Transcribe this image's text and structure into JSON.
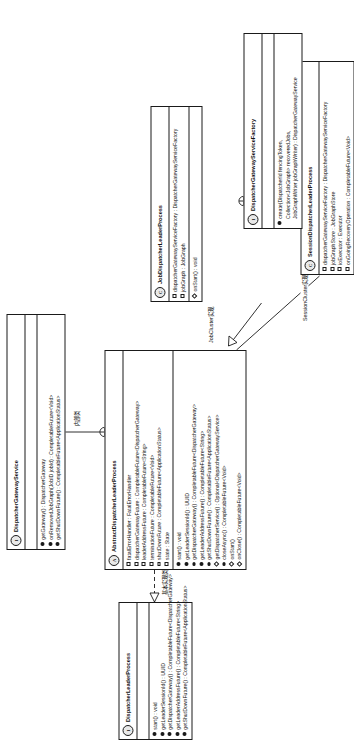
{
  "diagram": {
    "type": "uml-class-diagram",
    "orientation": "landscape-on-portrait-page",
    "colors": {
      "line": "#1a1a1a",
      "background": "#ffffff",
      "badge_fill": "#e9e9e9"
    },
    "edge_labels": {
      "basic_impl": "基本实现类",
      "inner_class": "内部类",
      "inner_class_2": "内部类",
      "job_cluster_impl": "JobCluster实现",
      "session_cluster_impl": "SessionCluster实现"
    }
  },
  "classes": {
    "dispatcher_leader_process": {
      "stereotype": "I",
      "name": "DispatcherLeaderProcess",
      "attributes": [],
      "methods": [
        {
          "marker": "public",
          "text": "start() : void"
        },
        {
          "marker": "public",
          "text": "getLeaderSessionId() : UUID"
        },
        {
          "marker": "public",
          "text": "getDispatcherGateway() : CompletableFuture<DispatcherGateway>"
        },
        {
          "marker": "public",
          "text": "getLeaderAddressFuture() : CompletableFuture<String>"
        },
        {
          "marker": "public",
          "text": "getShutDownFuture() : CompletableFuture<ApplicationStatus>"
        }
      ]
    },
    "abstract_dispatcher_leader_process": {
      "stereotype": "A",
      "name": "AbstractDispatcherLeaderProcess",
      "attributes": [
        {
          "marker": "attribute",
          "text": "fatalErrorHandler : FatalErrorHandler"
        },
        {
          "marker": "attribute",
          "text": "dispatcherGatewayFuture : CompletableFuture<DispatcherGateway>"
        },
        {
          "marker": "attribute",
          "text": "leaderAddressFuture : CompletableFuture<String>"
        },
        {
          "marker": "attribute",
          "text": "terminationFuture : CompletableFuture<Void>"
        },
        {
          "marker": "attribute",
          "text": "shutDownFuture : CompletableFuture<ApplicationStatus>"
        },
        {
          "marker": "attribute",
          "text": "state : State"
        }
      ],
      "methods": [
        {
          "marker": "public",
          "text": "start() : void"
        },
        {
          "marker": "public",
          "text": "getLeaderSessionId() : UUID"
        },
        {
          "marker": "public",
          "text": "getDispatcherGateway() : CompletableFuture<DispatcherGateway>"
        },
        {
          "marker": "public",
          "text": "getLeaderAddressFuture() : CompletableFuture<String>"
        },
        {
          "marker": "public",
          "text": "getShutDownFuture() : CompletableFuture<ApplicationStatus>"
        },
        {
          "marker": "protected",
          "text": "getDispatcherService() : Optional<DispatcherGatewayService>"
        },
        {
          "marker": "public",
          "text": "closeAsync() : CompletableFuture<Void>"
        },
        {
          "marker": "protected",
          "text": "onStart()"
        },
        {
          "marker": "protected",
          "text": "onClose() : CompletableFuture<Void>"
        }
      ]
    },
    "dispatcher_gateway_service": {
      "stereotype": "I",
      "name": "DispatcherGatewayService",
      "attributes": [],
      "methods": [
        {
          "marker": "public",
          "text": "getGateway() : DispatcherGateway"
        },
        {
          "marker": "public",
          "text": "onRemovedJobGraph(JobID jobId) : CompletableFuture<Void>"
        },
        {
          "marker": "public",
          "text": "getShutDownFuture() : CompletableFuture<ApplicationStatus>"
        }
      ]
    },
    "job_dispatcher_leader_process": {
      "stereotype": "C",
      "name": "JobDispatcherLeaderProcess",
      "attributes": [
        {
          "marker": "attribute",
          "text": "dispatcherGatewayServiceFactory : DispatcherGatewayServiceFactory"
        },
        {
          "marker": "attribute",
          "text": "jobGraph : JobGraph"
        }
      ],
      "methods": [
        {
          "marker": "protected",
          "text": "onStart() : void"
        }
      ]
    },
    "session_dispatcher_leader_process": {
      "stereotype": "C",
      "name": "SessionDispatcherLeaderProcess",
      "attributes": [
        {
          "marker": "attribute",
          "text": "dispatcherGatewayServiceFactory : DispatcherGatewayServiceFactory"
        },
        {
          "marker": "attribute",
          "text": "jobGraphStore : JobGraphStore"
        },
        {
          "marker": "attribute",
          "text": "ioExecutor : Executor"
        }
      ],
      "methods": [
        {
          "marker": "public",
          "text": "onGoingRecoveryOperation : CompletableFuture<Void>"
        }
      ]
    },
    "dispatcher_gateway_service_factory": {
      "stereotype": "I",
      "name": "DispatcherGatewayServiceFactory",
      "attributes": [],
      "methods": [
        {
          "marker": "public",
          "text": "create(DispatcherId fencingToken,"
        },
        {
          "marker": "none",
          "text": "Collection<JobGraph> recoveredJobs,"
        },
        {
          "marker": "none",
          "text": "JobGraphWriter jobGraphWriter) : DispatcherGatewayService"
        }
      ]
    }
  }
}
